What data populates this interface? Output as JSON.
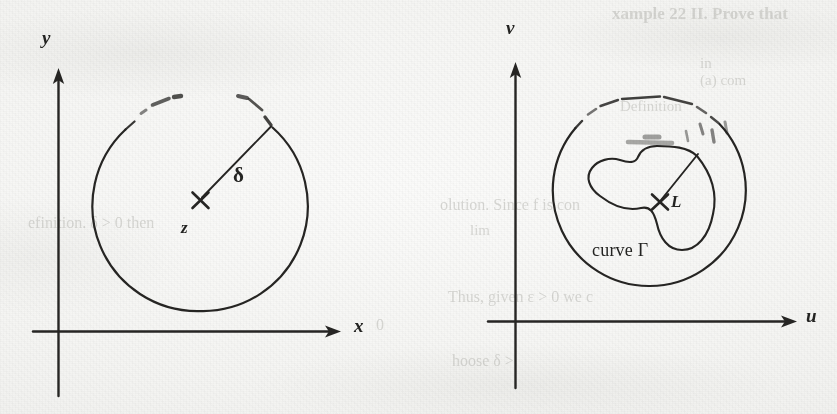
{
  "figure": {
    "kind": "textbook-scan-figure",
    "caption_text": "",
    "ink_color": "#262523",
    "paper_color": "#f4f4f2"
  },
  "left_panel": {
    "name": "z-plane",
    "axis_x_label": "x",
    "axis_y_label": "y",
    "center_point_label": "z",
    "center_marker": "x-cross-mark",
    "radius_label": "δ",
    "disk_description": "circle-around-z-of-radius-delta"
  },
  "right_panel": {
    "name": "w-plane",
    "axis_x_label": "u",
    "axis_y_label": "v",
    "center_point_label": "L",
    "center_marker": "x-cross-mark",
    "curve_label": "curve Γ",
    "disk_description": "circle-around-L-containing-curve-gamma"
  },
  "bleed_through": [
    {
      "id": "bt-1",
      "text": "xample 22 II. Prove that",
      "x": 612,
      "y": 4,
      "size": 17,
      "bold": true,
      "rotate": 0
    },
    {
      "id": "bt-2",
      "text": "in",
      "x": 700,
      "y": 55,
      "size": 15,
      "bold": false,
      "rotate": 0
    },
    {
      "id": "bt-3",
      "text": "Definition",
      "x": 620,
      "y": 98,
      "size": 15,
      "bold": false,
      "rotate": 0
    },
    {
      "id": "bt-4",
      "text": "olution. Since f  is con",
      "x": 440,
      "y": 196,
      "size": 16,
      "bold": false,
      "rotate": 0
    },
    {
      "id": "bt-5",
      "text": "lim",
      "x": 470,
      "y": 222,
      "size": 15,
      "bold": false,
      "rotate": 0
    },
    {
      "id": "bt-6",
      "text": "Thus, given  ε > 0 we c",
      "x": 448,
      "y": 288,
      "size": 16,
      "bold": false,
      "rotate": 0
    },
    {
      "id": "bt-7",
      "text": "hoose  δ >",
      "x": 452,
      "y": 352,
      "size": 16,
      "bold": false,
      "rotate": 0
    },
    {
      "id": "bt-8",
      "text": "efinition.  δ > 0 then",
      "x": 28,
      "y": 214,
      "size": 16,
      "bold": false,
      "rotate": 0
    },
    {
      "id": "bt-9",
      "text": "0",
      "x": 376,
      "y": 316,
      "size": 16,
      "bold": false,
      "rotate": 0
    },
    {
      "id": "bt-10",
      "text": "(a)  com",
      "x": 700,
      "y": 72,
      "size": 15,
      "bold": false,
      "rotate": 0
    }
  ]
}
